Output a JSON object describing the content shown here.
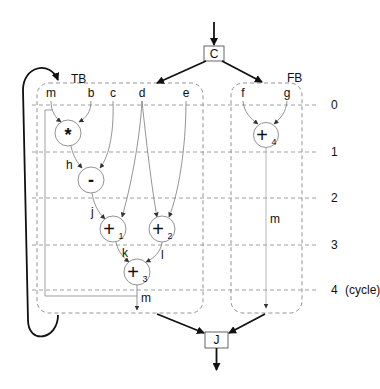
{
  "diagram": {
    "entry_block": "C",
    "exit_block": "J",
    "true_block": {
      "label": "TB",
      "inputs": [
        "m",
        "b",
        "c",
        "d",
        "e"
      ],
      "nodes": [
        {
          "id": "mul",
          "op": "*",
          "sub": ""
        },
        {
          "id": "sub",
          "op": "-",
          "sub": ""
        },
        {
          "id": "add1",
          "op": "+",
          "sub": "1"
        },
        {
          "id": "add2",
          "op": "+",
          "sub": "2"
        },
        {
          "id": "add3",
          "op": "+",
          "sub": "3"
        }
      ],
      "edge_labels": {
        "h": "h",
        "j": "j",
        "k": "k",
        "l": "l",
        "m": "m"
      }
    },
    "false_block": {
      "label": "FB",
      "inputs": [
        "f",
        "g"
      ],
      "nodes": [
        {
          "id": "add4",
          "op": "+",
          "sub": "4"
        }
      ],
      "edge_labels": {
        "m": "m"
      }
    },
    "cycles": [
      "0",
      "1",
      "2",
      "3",
      "4"
    ],
    "cycle_suffix": "(cycle)",
    "colors": {
      "line": "#333333",
      "dashed": "#888888",
      "thin": "#777777"
    }
  }
}
